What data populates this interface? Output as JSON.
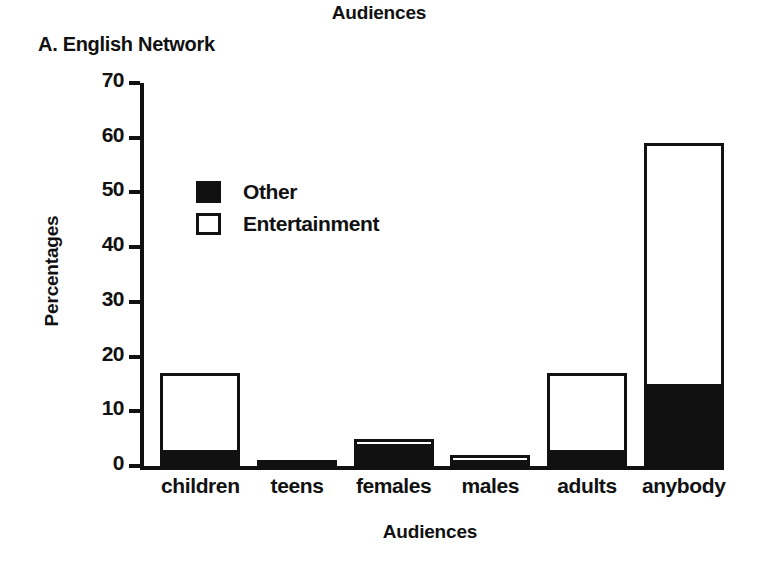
{
  "figure": {
    "title": "Audiences",
    "panel_label": "A. English Network"
  },
  "chart_data": {
    "type": "bar",
    "subtype": "stacked-bar",
    "title": "Audiences",
    "panel_label": "A. English Network",
    "xlabel": "Audiences",
    "ylabel": "Percentages",
    "ylim": [
      0,
      70
    ],
    "yticks": [
      0,
      10,
      20,
      30,
      40,
      50,
      60,
      70
    ],
    "ytick_labels": [
      "0",
      "10",
      "20",
      "30",
      "40",
      "50",
      "60",
      "70"
    ],
    "grid": false,
    "legend_position": "upper-left-inside",
    "categories": [
      "children",
      "teens",
      "females",
      "males",
      "adults",
      "anybody"
    ],
    "series": [
      {
        "name": "Other",
        "color": "#111111",
        "fill": "solid-black",
        "values": [
          3,
          1,
          4,
          1,
          3,
          15
        ]
      },
      {
        "name": "Entertainment",
        "color": "#ffffff",
        "fill": "open-white",
        "values": [
          14,
          0,
          1,
          1,
          14,
          44
        ]
      }
    ],
    "totals": [
      17,
      1,
      5,
      2,
      17,
      59
    ]
  },
  "legend": {
    "items": [
      {
        "label": "Other",
        "swatch": "filled-square"
      },
      {
        "label": "Entertainment",
        "swatch": "open-square"
      }
    ]
  },
  "colors": {
    "ink": "#111111",
    "background": "#ffffff",
    "other_fill": "#111111",
    "entertainment_fill": "#ffffff"
  }
}
